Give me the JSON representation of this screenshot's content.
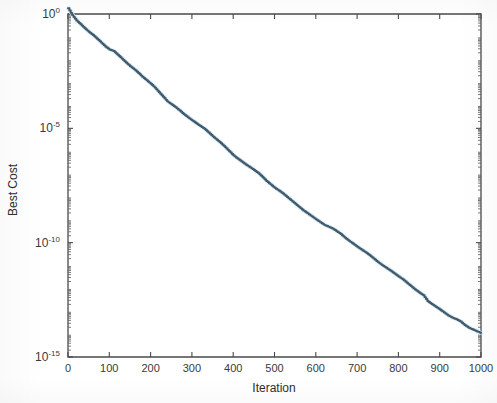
{
  "figure": {
    "background_color": "#ffffff",
    "line_color": "#3f5a6b",
    "axis_color": "#4a4a4a",
    "text_color": "#3a3a3a"
  },
  "chart_data": {
    "type": "line",
    "title": "",
    "xlabel": "Iteration",
    "ylabel": "Best Cost",
    "yscale": "log",
    "xscale": "linear",
    "xlim": [
      0,
      1000
    ],
    "ylim": [
      1e-15,
      2
    ],
    "grid": false,
    "legend": null,
    "xticks": [
      0,
      100,
      200,
      300,
      400,
      500,
      600,
      700,
      800,
      900,
      1000
    ],
    "xticklabels": [
      "0",
      "100",
      "200",
      "300",
      "400",
      "500",
      "600",
      "700",
      "800",
      "900",
      "1000"
    ],
    "yticks": [
      1,
      1e-05,
      1e-10,
      1e-15
    ],
    "yticklabels": [
      "10^0",
      "10^-5",
      "10^-10",
      "10^-15"
    ],
    "yticklabels_parts": [
      {
        "base": "10",
        "exp": "0"
      },
      {
        "base": "10",
        "exp": "-5"
      },
      {
        "base": "10",
        "exp": "-10"
      },
      {
        "base": "10",
        "exp": "-15"
      }
    ],
    "series": [
      {
        "name": "Best Cost",
        "color": "#3f5a6b",
        "x": [
          0,
          10,
          20,
          30,
          40,
          50,
          60,
          70,
          80,
          90,
          100,
          110,
          120,
          130,
          140,
          150,
          160,
          170,
          180,
          190,
          200,
          210,
          220,
          230,
          240,
          250,
          260,
          270,
          280,
          290,
          300,
          310,
          320,
          330,
          340,
          350,
          360,
          370,
          380,
          390,
          400,
          410,
          420,
          430,
          440,
          450,
          460,
          470,
          480,
          490,
          500,
          510,
          520,
          530,
          540,
          550,
          560,
          570,
          580,
          590,
          600,
          610,
          620,
          630,
          640,
          650,
          660,
          670,
          680,
          690,
          700,
          710,
          720,
          730,
          740,
          750,
          760,
          770,
          780,
          790,
          800,
          810,
          820,
          830,
          840,
          850,
          860,
          870,
          880,
          890,
          900,
          910,
          920,
          930,
          940,
          950,
          960,
          970,
          980,
          990,
          1000
        ],
        "y_log10": [
          0.25,
          -0.05,
          -0.28,
          -0.45,
          -0.62,
          -0.78,
          -0.92,
          -1.08,
          -1.25,
          -1.42,
          -1.55,
          -1.62,
          -1.78,
          -1.95,
          -2.12,
          -2.28,
          -2.42,
          -2.58,
          -2.75,
          -2.9,
          -3.05,
          -3.22,
          -3.42,
          -3.62,
          -3.82,
          -3.95,
          -4.08,
          -4.22,
          -4.38,
          -4.52,
          -4.65,
          -4.78,
          -4.9,
          -5.02,
          -5.18,
          -5.35,
          -5.5,
          -5.65,
          -5.82,
          -6.0,
          -6.18,
          -6.32,
          -6.45,
          -6.58,
          -6.7,
          -6.82,
          -6.95,
          -7.12,
          -7.3,
          -7.45,
          -7.6,
          -7.72,
          -7.85,
          -8.0,
          -8.15,
          -8.3,
          -8.45,
          -8.6,
          -8.72,
          -8.85,
          -8.98,
          -9.1,
          -9.22,
          -9.3,
          -9.38,
          -9.5,
          -9.62,
          -9.78,
          -9.92,
          -10.05,
          -10.18,
          -10.3,
          -10.42,
          -10.55,
          -10.7,
          -10.85,
          -10.98,
          -11.1,
          -11.22,
          -11.35,
          -11.48,
          -11.6,
          -11.75,
          -11.9,
          -12.05,
          -12.18,
          -12.3,
          -12.55,
          -12.68,
          -12.8,
          -12.92,
          -13.05,
          -13.18,
          -13.28,
          -13.35,
          -13.45,
          -13.6,
          -13.72,
          -13.8,
          -13.88,
          -13.95
        ],
        "description": "Monotonically decreasing staircase convergence curve from about 1.8 at iteration 0 down to about 1.1e-14 at iteration 1000"
      }
    ]
  }
}
